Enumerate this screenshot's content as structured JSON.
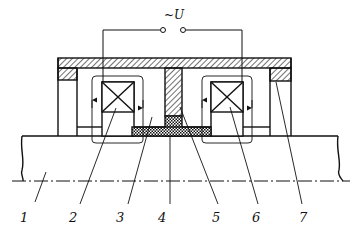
{
  "diagram": {
    "type": "electromagnetic device cross-section",
    "supply_label": "~U",
    "labels": [
      {
        "id": "1",
        "text": "1",
        "part": "shaft"
      },
      {
        "id": "2",
        "text": "2",
        "part": "left coil"
      },
      {
        "id": "3",
        "text": "3",
        "part": "magnetic core / cavity"
      },
      {
        "id": "4",
        "text": "4",
        "part": "working gap (magnetic fluid)"
      },
      {
        "id": "5",
        "text": "5",
        "part": "central pole piece"
      },
      {
        "id": "6",
        "text": "6",
        "part": "right coil"
      },
      {
        "id": "7",
        "text": "7",
        "part": "outer housing / end ring"
      }
    ],
    "colors": {
      "line": "#111111",
      "background": "#ffffff"
    }
  }
}
